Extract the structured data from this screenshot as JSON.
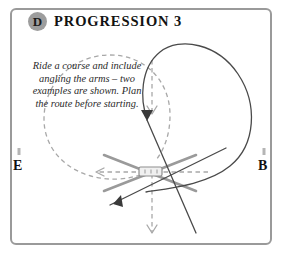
{
  "card": {
    "badge_letter": "D",
    "title": "PROGRESSION 3",
    "instructions": "Ride a course and include angling the arms – two examples are shown. Plan the route before starting.",
    "frame_color": "#9a9a9a",
    "badge_color": "#9d9d9d"
  },
  "arena": {
    "markers": [
      {
        "id": "marker-e",
        "label": "E",
        "side": "left"
      },
      {
        "id": "marker-b",
        "label": "B",
        "side": "right"
      }
    ],
    "obstacle": {
      "name": "centre-jump",
      "label": ""
    }
  },
  "diagram": {
    "route_solid_color": "#4a4a4a",
    "route_dashed_color": "#a8a8a8",
    "arm_color": "#9a9a9a",
    "routes": [
      {
        "name": "dashed-loop-left",
        "style": "dashed",
        "direction": "counter-clockwise"
      },
      {
        "name": "solid-loop-right",
        "style": "solid",
        "direction": "clockwise"
      },
      {
        "name": "dashed-centre-line",
        "style": "dashed",
        "direction": "downward"
      },
      {
        "name": "dashed-approach-line",
        "style": "dashed",
        "direction": "leftward"
      },
      {
        "name": "solid-angled-approach",
        "style": "solid",
        "direction": "toward-jump"
      }
    ],
    "arms": [
      {
        "name": "arm-nw-se"
      },
      {
        "name": "arm-sw-ne"
      }
    ]
  }
}
